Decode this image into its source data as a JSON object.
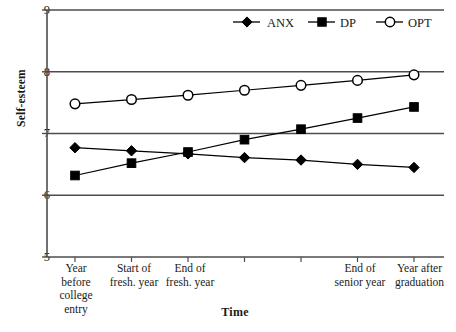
{
  "chart_data": {
    "type": "line",
    "title": "",
    "xlabel": "Time",
    "ylabel": "Self-esteem",
    "ylim": [
      5,
      9
    ],
    "yticks": [
      5,
      6,
      7,
      8,
      9
    ],
    "grid": "horizontal",
    "legend_position": "top-right",
    "categories": [
      "Year\nbefore\ncollege\nentry",
      "Start of\nfresh. year",
      "End of\nfresh. year",
      "",
      "",
      "End of\nsenior year",
      "Year after\ngraduation"
    ],
    "series": [
      {
        "name": "ANX",
        "marker": "filled-diamond",
        "color": "#000000",
        "values": [
          6.77,
          6.72,
          6.67,
          6.61,
          6.57,
          6.5,
          6.45
        ]
      },
      {
        "name": "DP",
        "marker": "filled-square",
        "color": "#000000",
        "values": [
          6.32,
          6.52,
          6.7,
          6.9,
          7.07,
          7.25,
          7.43
        ]
      },
      {
        "name": "OPT",
        "marker": "open-circle",
        "color": "#000000",
        "values": [
          7.48,
          7.55,
          7.62,
          7.7,
          7.78,
          7.86,
          7.95
        ]
      }
    ]
  },
  "axis": {
    "y_tick_labels": [
      "9",
      "8",
      "7",
      "6",
      "5"
    ],
    "y_title": "Self-esteem",
    "x_title": "Time",
    "x_tick_labels": [
      "Year\nbefore\ncollege\nentry",
      "Start of\nfresh. year",
      "End of\nfresh. year",
      "",
      "",
      "End of\nsenior year",
      "Year after\ngraduation"
    ]
  },
  "legend": {
    "entries": [
      {
        "label": "ANX",
        "marker": "filled-diamond"
      },
      {
        "label": "DP",
        "marker": "filled-square"
      },
      {
        "label": "OPT",
        "marker": "open-circle"
      }
    ]
  }
}
